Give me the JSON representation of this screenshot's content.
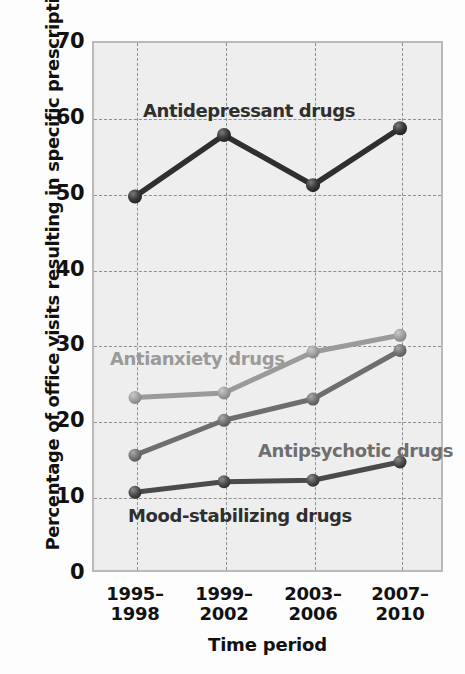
{
  "chart_data": {
    "type": "line",
    "title": "",
    "xlabel": "Time period",
    "ylabel": "Percentage of office visits resulting in specific prescriptions",
    "categories": [
      "1995–1998",
      "1999–2002",
      "2003–2006",
      "2007–2010"
    ],
    "category_lines": [
      [
        "1995–",
        "1998"
      ],
      [
        "1999–",
        "2002"
      ],
      [
        "2003–",
        "2006"
      ],
      [
        "2007–",
        "2010"
      ]
    ],
    "ylim": [
      0,
      70
    ],
    "yticks": [
      0,
      10,
      20,
      30,
      40,
      50,
      60,
      70
    ],
    "grid": true,
    "legend_position": "inline-annotations",
    "series": [
      {
        "name": "Antidepressant drugs",
        "color": "#2f2f2f",
        "values": [
          49.5,
          57.6,
          51.0,
          58.5
        ]
      },
      {
        "name": "Antianxiety drugs",
        "color": "#9a9a9a",
        "values": [
          23.0,
          23.6,
          29.0,
          31.2
        ]
      },
      {
        "name": "Antipsychotic drugs",
        "color": "#6e6e6e",
        "values": [
          15.4,
          20.0,
          22.8,
          29.2
        ]
      },
      {
        "name": "Mood-stabilizing drugs",
        "color": "#4a4a4a",
        "values": [
          10.5,
          11.9,
          12.1,
          14.5
        ]
      }
    ]
  },
  "annotations": {
    "antidepressant": "Antidepressant drugs",
    "antianxiety": "Antianxiety drugs",
    "antipsychotic": "Antipsychotic drugs",
    "mood": "Mood-stabilizing drugs"
  },
  "colors": {
    "plot_background": "#eeeeee",
    "grid": "#8e8e8e",
    "axis": "#b9b9b9",
    "text": "#111111"
  }
}
